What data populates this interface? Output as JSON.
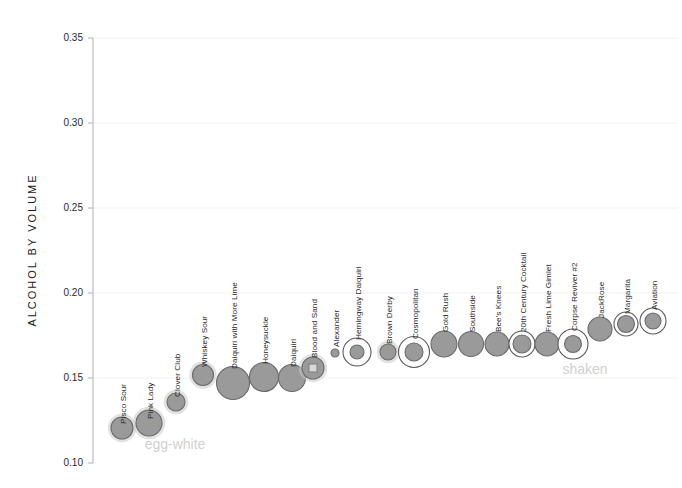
{
  "chart_data": {
    "type": "scatter",
    "title": "",
    "xlabel": "",
    "ylabel": "ALCOHOL BY VOLUME",
    "ylim": [
      0.1,
      0.35
    ],
    "yticks": [
      0.1,
      0.15,
      0.2,
      0.25,
      0.3,
      0.35
    ],
    "ytick_labels": [
      "0.10",
      "0.15",
      "0.20",
      "0.25",
      "0.30",
      "0.35"
    ],
    "grid": "horizontal",
    "legend_position": "none",
    "x_axis": "ordered by alcohol by volume (categorical, unlabeled)",
    "annotations": [
      {
        "text": "egg-white",
        "x": 175,
        "y": 449,
        "color": "#d4d4d4"
      },
      {
        "text": "shaken",
        "x": 585,
        "y": 374,
        "color": "#d0d0d0"
      }
    ],
    "marker_encoding": {
      "fill_color": "#9a9a9a",
      "fill_stroke": "#6f6f6f",
      "halo_note": "soft gray halo = egg-white group",
      "ring_note": "open white outer ring = shaken group",
      "size_note": "radius encodes drink volume"
    },
    "categories": [
      "Pisco Sour",
      "Pink Lady",
      "Clover Club",
      "Whiskey Sour",
      "Daiquiri with More Lime",
      "Honeysuckle",
      "Daiquiri",
      "Blood and Sand",
      "Alexander",
      "Hemingway Daiquiri",
      "Brown Derby",
      "Cosmopolitan",
      "Gold Rush",
      "Southside",
      "Bee's Knees",
      "20th Century Cocktail",
      "Fresh Lime Gimlet",
      "Corpse Reviver #2",
      "JackRose",
      "Margarita",
      "Aviation"
    ],
    "values": [
      0.121,
      0.124,
      0.136,
      0.152,
      0.147,
      0.151,
      0.15,
      0.156,
      0.166,
      0.167,
      0.166,
      0.166,
      0.172,
      0.172,
      0.172,
      0.172,
      0.172,
      0.172,
      0.181,
      0.184,
      0.186
    ],
    "points": [
      {
        "name": "Pisco Sour",
        "abv": 0.121,
        "cx": 122,
        "cy": 428,
        "r": 11.0,
        "halo": true,
        "ring": false,
        "inner": 0
      },
      {
        "name": "Pink Lady",
        "abv": 0.124,
        "cx": 149,
        "cy": 423,
        "r": 13.0,
        "halo": true,
        "ring": false,
        "inner": 0
      },
      {
        "name": "Clover Club",
        "abv": 0.136,
        "cx": 176,
        "cy": 402,
        "r": 9.0,
        "halo": true,
        "ring": false,
        "inner": 0
      },
      {
        "name": "Whiskey Sour",
        "abv": 0.152,
        "cx": 203,
        "cy": 375,
        "r": 10.5,
        "halo": true,
        "ring": false,
        "inner": 0
      },
      {
        "name": "Daiquiri with More Lime",
        "abv": 0.147,
        "cx": 233,
        "cy": 383,
        "r": 16.5,
        "halo": false,
        "ring": false,
        "inner": 0
      },
      {
        "name": "Honeysuckle",
        "abv": 0.151,
        "cx": 264,
        "cy": 377,
        "r": 14.5,
        "halo": false,
        "ring": false,
        "inner": 0
      },
      {
        "name": "Daiquiri",
        "abv": 0.15,
        "cx": 292,
        "cy": 378,
        "r": 13.5,
        "halo": false,
        "ring": false,
        "inner": 0
      },
      {
        "name": "Blood and Sand",
        "abv": 0.156,
        "cx": 313,
        "cy": 368,
        "r": 11.0,
        "halo": true,
        "ring": false,
        "inner": 4
      },
      {
        "name": "Alexander",
        "abv": 0.166,
        "cx": 335,
        "cy": 353,
        "r": 4.0,
        "halo": false,
        "ring": false,
        "inner": 0
      },
      {
        "name": "Hemingway Daiquiri",
        "abv": 0.167,
        "cx": 357,
        "cy": 352,
        "r": 7.0,
        "halo": false,
        "ring": true,
        "ring_r": 14.0,
        "inner": 0
      },
      {
        "name": "Brown Derby",
        "abv": 0.166,
        "cx": 388,
        "cy": 352,
        "r": 8.0,
        "halo": true,
        "ring": false,
        "inner": 0
      },
      {
        "name": "Cosmopolitan",
        "abv": 0.166,
        "cx": 414,
        "cy": 352,
        "r": 9.0,
        "halo": false,
        "ring": true,
        "ring_r": 15.5,
        "inner": 0
      },
      {
        "name": "Gold Rush",
        "abv": 0.172,
        "cx": 444,
        "cy": 344,
        "r": 13.0,
        "halo": false,
        "ring": false,
        "inner": 0
      },
      {
        "name": "Southside",
        "abv": 0.172,
        "cx": 471,
        "cy": 344,
        "r": 12.5,
        "halo": false,
        "ring": false,
        "inner": 0
      },
      {
        "name": "Bee's Knees",
        "abv": 0.172,
        "cx": 497,
        "cy": 344,
        "r": 12.0,
        "halo": false,
        "ring": false,
        "inner": 0
      },
      {
        "name": "20th Century Cocktail",
        "abv": 0.172,
        "cx": 522,
        "cy": 344,
        "r": 9.0,
        "halo": false,
        "ring": true,
        "ring_r": 13.0,
        "inner": 0
      },
      {
        "name": "Fresh Lime Gimlet",
        "abv": 0.172,
        "cx": 547,
        "cy": 344,
        "r": 12.0,
        "halo": false,
        "ring": false,
        "inner": 0
      },
      {
        "name": "Corpse Reviver #2",
        "abv": 0.172,
        "cx": 573,
        "cy": 344,
        "r": 8.5,
        "halo": false,
        "ring": true,
        "ring_r": 15.0,
        "inner": 0
      },
      {
        "name": "JackRose",
        "abv": 0.181,
        "cx": 600,
        "cy": 329,
        "r": 12.0,
        "halo": false,
        "ring": false,
        "inner": 0
      },
      {
        "name": "Margarita",
        "abv": 0.184,
        "cx": 626,
        "cy": 324,
        "r": 8.5,
        "halo": false,
        "ring": true,
        "ring_r": 12.0,
        "inner": 0
      },
      {
        "name": "Aviation",
        "abv": 0.186,
        "cx": 653,
        "cy": 321,
        "r": 8.0,
        "halo": false,
        "ring": true,
        "ring_r": 13.0,
        "inner": 0
      }
    ],
    "label_positions": [
      {
        "name": "Pisco Sour",
        "x": 126,
        "y": 424
      },
      {
        "name": "Pink Lady",
        "x": 153,
        "y": 419
      },
      {
        "name": "Clover Club",
        "x": 180,
        "y": 397
      },
      {
        "name": "Whiskey Sour",
        "x": 207,
        "y": 367
      },
      {
        "name": "Daiquiri with More Lime",
        "x": 237,
        "y": 369
      },
      {
        "name": "Honeysuckle",
        "x": 268,
        "y": 364
      },
      {
        "name": "Daiquiri",
        "x": 296,
        "y": 367
      },
      {
        "name": "Blood and Sand",
        "x": 317,
        "y": 358
      },
      {
        "name": "Alexander",
        "x": 339,
        "y": 347
      },
      {
        "name": "Hemingway Daiquiri",
        "x": 361,
        "y": 340
      },
      {
        "name": "Brown Derby",
        "x": 392,
        "y": 344
      },
      {
        "name": "Cosmopolitan",
        "x": 418,
        "y": 339
      },
      {
        "name": "Gold Rush",
        "x": 448,
        "y": 332
      },
      {
        "name": "Southside",
        "x": 475,
        "y": 332
      },
      {
        "name": "Bee's Knees",
        "x": 501,
        "y": 332
      },
      {
        "name": "20th Century Cocktail",
        "x": 526,
        "y": 332
      },
      {
        "name": "Fresh Lime Gimlet",
        "x": 551,
        "y": 332
      },
      {
        "name": "Corpse Reviver #2",
        "x": 577,
        "y": 331
      },
      {
        "name": "JackRose",
        "x": 604,
        "y": 318
      },
      {
        "name": "Margarita",
        "x": 630,
        "y": 314
      },
      {
        "name": "Aviation",
        "x": 657,
        "y": 310
      }
    ]
  },
  "axis": {
    "y_title": "ALCOHOL BY VOLUME",
    "ticks": [
      {
        "label": "0.35",
        "y": 38
      },
      {
        "label": "0.30",
        "y": 123
      },
      {
        "label": "0.25",
        "y": 208
      },
      {
        "label": "0.20",
        "y": 293
      },
      {
        "label": "0.15",
        "y": 378
      },
      {
        "label": "0.10",
        "y": 463
      }
    ]
  },
  "annotations": {
    "egg_white": "egg-white",
    "shaken": "shaken"
  }
}
